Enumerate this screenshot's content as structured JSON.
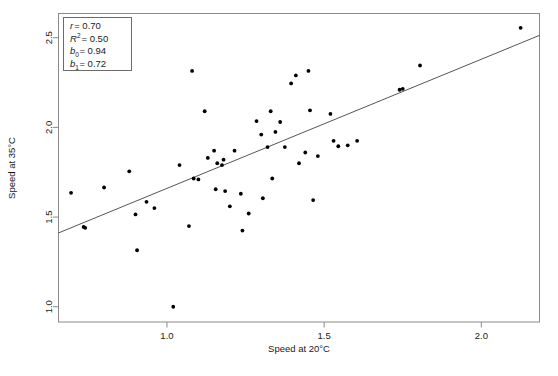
{
  "chart_data": {
    "type": "scatter",
    "title": "",
    "xlabel": "Speed at 20°C",
    "ylabel": "Speed at 35°C",
    "xlim": [
      0.655,
      2.185
    ],
    "ylim": [
      0.915,
      2.635
    ],
    "xticks": [
      1.0,
      1.5,
      2.0
    ],
    "xtick_labels": [
      "1.0",
      "1.5",
      "2.0"
    ],
    "yticks": [
      1.0,
      1.5,
      2.0,
      2.5
    ],
    "ytick_labels": [
      "1.0",
      "1.5",
      "2.0",
      "2.5"
    ],
    "grid": false,
    "legend": "none",
    "point_color": "#000000",
    "line_color": "#555555",
    "frame_color": "#888888",
    "points": [
      [
        0.695,
        1.635
      ],
      [
        0.735,
        1.445
      ],
      [
        0.74,
        1.44
      ],
      [
        0.8,
        1.665
      ],
      [
        0.88,
        1.755
      ],
      [
        0.9,
        1.515
      ],
      [
        0.905,
        1.315
      ],
      [
        0.935,
        1.585
      ],
      [
        0.96,
        1.55
      ],
      [
        1.02,
        1.0
      ],
      [
        1.04,
        1.79
      ],
      [
        1.07,
        1.45
      ],
      [
        1.08,
        2.315
      ],
      [
        1.085,
        1.715
      ],
      [
        1.1,
        1.71
      ],
      [
        1.12,
        2.09
      ],
      [
        1.13,
        1.83
      ],
      [
        1.15,
        1.87
      ],
      [
        1.155,
        1.655
      ],
      [
        1.16,
        1.8
      ],
      [
        1.175,
        1.79
      ],
      [
        1.18,
        1.82
      ],
      [
        1.185,
        1.645
      ],
      [
        1.2,
        1.56
      ],
      [
        1.215,
        1.87
      ],
      [
        1.235,
        1.63
      ],
      [
        1.24,
        1.425
      ],
      [
        1.26,
        1.52
      ],
      [
        1.285,
        2.035
      ],
      [
        1.3,
        1.96
      ],
      [
        1.305,
        1.605
      ],
      [
        1.32,
        1.89
      ],
      [
        1.33,
        2.09
      ],
      [
        1.335,
        1.715
      ],
      [
        1.345,
        1.975
      ],
      [
        1.36,
        2.03
      ],
      [
        1.375,
        1.89
      ],
      [
        1.395,
        2.245
      ],
      [
        1.41,
        2.29
      ],
      [
        1.42,
        1.8
      ],
      [
        1.44,
        1.86
      ],
      [
        1.45,
        2.315
      ],
      [
        1.455,
        2.095
      ],
      [
        1.465,
        1.595
      ],
      [
        1.48,
        1.84
      ],
      [
        1.52,
        2.075
      ],
      [
        1.53,
        1.925
      ],
      [
        1.545,
        1.895
      ],
      [
        1.575,
        1.9
      ],
      [
        1.605,
        1.925
      ],
      [
        1.74,
        2.21
      ],
      [
        1.75,
        2.215
      ],
      [
        1.805,
        2.345
      ],
      [
        2.125,
        2.555
      ]
    ],
    "regression": {
      "intercept": 0.94,
      "slope": 0.72
    },
    "stats_box": {
      "r_label": "r",
      "r_value": "= 0.70",
      "r2_label": "R",
      "r2_sup": "2",
      "r2_value": "= 0.50",
      "b0_label": "b",
      "b0_sub": "0",
      "b0_value": "= 0.94",
      "b1_label": "b",
      "b1_sub": "1",
      "b1_value": "= 0.72"
    }
  }
}
